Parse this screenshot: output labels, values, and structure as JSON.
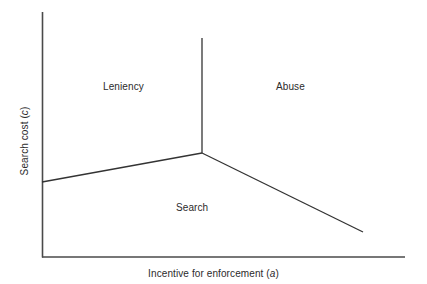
{
  "figure": {
    "kind": "regime-diagram",
    "background_color": "#ffffff",
    "line_color": "#333333"
  },
  "axes": {
    "x_title_text": "Incentive for enforcement (",
    "x_title_symbol": "a",
    "x_title_close": ")",
    "x_title_full": "Incentive for enforcement (a)",
    "y_title_text": "Search cost (",
    "y_title_symbol": "c",
    "y_title_close": ")",
    "y_title_full": "Search cost (c)"
  },
  "regions": [
    {
      "id": "leniency",
      "label": "Leniency"
    },
    {
      "id": "abuse",
      "label": "Abuse"
    },
    {
      "id": "search",
      "label": "Search"
    }
  ],
  "chart_data": {
    "type": "line",
    "title": "",
    "xlabel": "Incentive for enforcement (a)",
    "ylabel": "Search cost (c)",
    "grid": false,
    "legend": "none",
    "axis_frame": {
      "origin_px": [
        42,
        257
      ],
      "y_axis_top_px": [
        42,
        12
      ],
      "x_axis_right_px": [
        405,
        257
      ]
    },
    "annotations": [
      {
        "text": "Leniency",
        "position_px": [
          128,
          87
        ]
      },
      {
        "text": "Abuse",
        "position_px": [
          296,
          87
        ]
      },
      {
        "text": "Search",
        "position_px": [
          196,
          208
        ]
      }
    ],
    "series": [
      {
        "name": "leniency-abuse boundary (vertical)",
        "points_px": [
          [
            202,
            38
          ],
          [
            202,
            153
          ]
        ]
      },
      {
        "name": "leniency-search boundary (upward to junction)",
        "points_px": [
          [
            42,
            182
          ],
          [
            202,
            153
          ]
        ]
      },
      {
        "name": "abuse-search boundary (downward from junction)",
        "points_px": [
          [
            202,
            153
          ],
          [
            363,
            232
          ]
        ]
      }
    ],
    "junction_px": [
      202,
      153
    ]
  }
}
